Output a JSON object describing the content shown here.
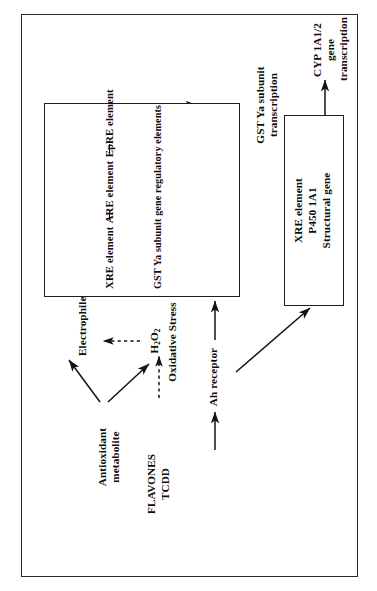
{
  "figure": {
    "orientation": "rotated-90-ccw",
    "border_color": "#2c2c2c",
    "background": "#ffffff",
    "text_color": "#0d0d0d"
  },
  "nodes": {
    "antioxidant_metabolite": "Antioxidant  metabolite",
    "electrophiles": "Electrophiles",
    "h2o2": "H2O2",
    "h2o2_sub": "2",
    "h2o2_lead": "H",
    "h2o2_mid": "O",
    "oxidative_stress": "Oxidative Stress",
    "flavones": "FLAVONES",
    "tcdd": "TCDD",
    "ah_receptor": "Ah receptor",
    "sensor_q": "? Sensor",
    "nuclear_redox_sensor": "Nuclear redox\nsensor ?",
    "xre_element": "XRE element",
    "are_element": "ARE element",
    "epre_element": "EpRE element",
    "gst_ya_regulatory": "GST Ya subunit gene regulatory elements",
    "gst_ya_transcription": "GST Ya subunit\ntranscription",
    "similarly_note": "(Similarly NAD(P)H:quinone  reductase  gene)",
    "p450_box_line1": "XRE element",
    "p450_box_line2": "P450 1A1",
    "p450_box_line3": "Structural gene",
    "cyp_transcription": "CYP  1A1/2 gene\ntranscription"
  },
  "connectors": [
    {
      "name": "antioxidant-to-electrophiles",
      "style": "solid-arrow"
    },
    {
      "name": "antioxidant-to-h2o2",
      "style": "solid-arrow"
    },
    {
      "name": "h2o2-to-electrophiles",
      "style": "dashed-arrow"
    },
    {
      "name": "flavones-tcdd-to-h2o2",
      "style": "dashed-arrow"
    },
    {
      "name": "electrophiles-to-sensor",
      "style": "solid-arrow"
    },
    {
      "name": "sensor-to-epre",
      "style": "solid-arrow"
    },
    {
      "name": "oxidative-stress-to-nuclear-redox",
      "style": "solid-arrow"
    },
    {
      "name": "nuclear-redox-to-are",
      "style": "solid-arrow"
    },
    {
      "name": "flavones-tcdd-to-ah-receptor",
      "style": "solid-arrow"
    },
    {
      "name": "ah-receptor-to-xre",
      "style": "solid-arrow"
    },
    {
      "name": "ah-receptor-to-p450-box",
      "style": "solid-arrow"
    },
    {
      "name": "regulatory-box-to-gst-transcription",
      "style": "solid-arrow"
    },
    {
      "name": "p450-box-to-cyp-transcription",
      "style": "solid-arrow"
    }
  ]
}
